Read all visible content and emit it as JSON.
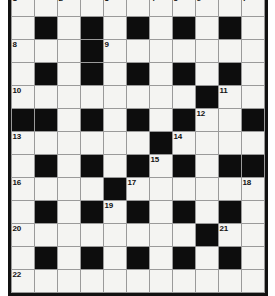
{
  "puzzle": {
    "title": "Crossword Grid",
    "rows": 12,
    "cols": 11,
    "cell_size_px": 22,
    "colors": {
      "block": "#0d0d0d",
      "open": "#f4f4f2",
      "grid_line": "#9a9a9a",
      "border": "#111111",
      "number_text": "#111111"
    },
    "legend": {
      "block_label": "blocked-square",
      "open_label": "open-square"
    },
    "grid": [
      [
        "o",
        "o",
        "o",
        "o",
        "o",
        "o",
        "o",
        "o",
        "o",
        "o",
        "o"
      ],
      [
        "o",
        "b",
        "o",
        "b",
        "o",
        "b",
        "o",
        "b",
        "o",
        "b",
        "o"
      ],
      [
        "o",
        "o",
        "o",
        "b",
        "o",
        "o",
        "o",
        "o",
        "o",
        "o",
        "o"
      ],
      [
        "o",
        "b",
        "o",
        "b",
        "o",
        "b",
        "o",
        "b",
        "o",
        "b",
        "o"
      ],
      [
        "o",
        "o",
        "o",
        "o",
        "o",
        "o",
        "o",
        "o",
        "b",
        "o",
        "o"
      ],
      [
        "b",
        "b",
        "o",
        "b",
        "o",
        "b",
        "o",
        "b",
        "o",
        "o",
        "b"
      ],
      [
        "o",
        "o",
        "o",
        "o",
        "o",
        "o",
        "b",
        "o",
        "o",
        "o",
        "o"
      ],
      [
        "o",
        "b",
        "o",
        "b",
        "o",
        "b",
        "o",
        "b",
        "o",
        "b",
        "b"
      ],
      [
        "o",
        "o",
        "o",
        "o",
        "b",
        "o",
        "o",
        "o",
        "o",
        "o",
        "o"
      ],
      [
        "o",
        "b",
        "o",
        "b",
        "o",
        "b",
        "o",
        "b",
        "o",
        "b",
        "o"
      ],
      [
        "o",
        "o",
        "o",
        "o",
        "o",
        "o",
        "o",
        "o",
        "b",
        "o",
        "o"
      ],
      [
        "o",
        "b",
        "o",
        "b",
        "o",
        "b",
        "o",
        "b",
        "o",
        "b",
        "o"
      ],
      [
        "o",
        "o",
        "o",
        "o",
        "o",
        "o",
        "o",
        "o",
        "o",
        "o",
        "o"
      ]
    ],
    "numbers": [
      {
        "n": "1",
        "row": 1,
        "col": 1
      },
      {
        "n": "2",
        "row": 1,
        "col": 3
      },
      {
        "n": "3",
        "row": 1,
        "col": 5
      },
      {
        "n": "4",
        "row": 1,
        "col": 7
      },
      {
        "n": "5",
        "row": 1,
        "col": 8
      },
      {
        "n": "6",
        "row": 1,
        "col": 9
      },
      {
        "n": "7",
        "row": 1,
        "col": 11
      },
      {
        "n": "8",
        "row": 3,
        "col": 1
      },
      {
        "n": "9",
        "row": 3,
        "col": 5
      },
      {
        "n": "10",
        "row": 5,
        "col": 1
      },
      {
        "n": "11",
        "row": 5,
        "col": 10
      },
      {
        "n": "12",
        "row": 6,
        "col": 9
      },
      {
        "n": "13",
        "row": 7,
        "col": 1
      },
      {
        "n": "14",
        "row": 7,
        "col": 8
      },
      {
        "n": "15",
        "row": 8,
        "col": 7
      },
      {
        "n": "16",
        "row": 9,
        "col": 1
      },
      {
        "n": "17",
        "row": 9,
        "col": 6
      },
      {
        "n": "18",
        "row": 9,
        "col": 11
      },
      {
        "n": "19",
        "row": 10,
        "col": 5
      },
      {
        "n": "20",
        "row": 11,
        "col": 1
      },
      {
        "n": "21",
        "row": 11,
        "col": 10
      },
      {
        "n": "22",
        "row": 13,
        "col": 1
      }
    ]
  }
}
